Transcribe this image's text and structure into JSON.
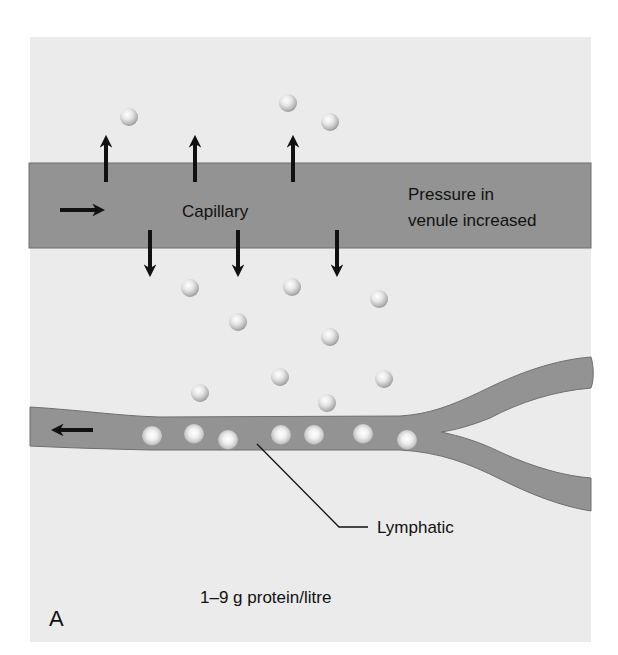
{
  "figure": {
    "panel_letter": "A",
    "background_color": "#ebebeb",
    "vessel_color": "#939393",
    "vessel_outline": "#6f6f6f",
    "arrow_color": "#111111"
  },
  "capillary": {
    "label": "Capillary",
    "condition_line1": "Pressure in",
    "condition_line2": "venule increased",
    "flow_direction": "right",
    "outward_arrows": [
      {
        "x": 106,
        "direction": "up"
      },
      {
        "x": 195,
        "direction": "up"
      },
      {
        "x": 293,
        "direction": "up"
      },
      {
        "x": 150,
        "direction": "down"
      },
      {
        "x": 238,
        "direction": "down"
      },
      {
        "x": 337,
        "direction": "down"
      }
    ]
  },
  "lymphatic": {
    "label": "Lymphatic",
    "flow_direction": "left"
  },
  "protein_note": "1–9 g protein/litre",
  "proteins": {
    "above_capillary": [
      [
        129,
        117
      ],
      [
        288,
        103
      ],
      [
        330,
        122
      ]
    ],
    "interstitial": [
      [
        190,
        288
      ],
      [
        292,
        287
      ],
      [
        379,
        299
      ],
      [
        238,
        322
      ],
      [
        330,
        337
      ],
      [
        200,
        393
      ],
      [
        280,
        377
      ],
      [
        327,
        403
      ],
      [
        384,
        379
      ]
    ],
    "in_lymphatic": [
      [
        152,
        436
      ],
      [
        194,
        434
      ],
      [
        228,
        440
      ],
      [
        281,
        435
      ],
      [
        314,
        435
      ],
      [
        363,
        434
      ],
      [
        407,
        440
      ]
    ]
  }
}
